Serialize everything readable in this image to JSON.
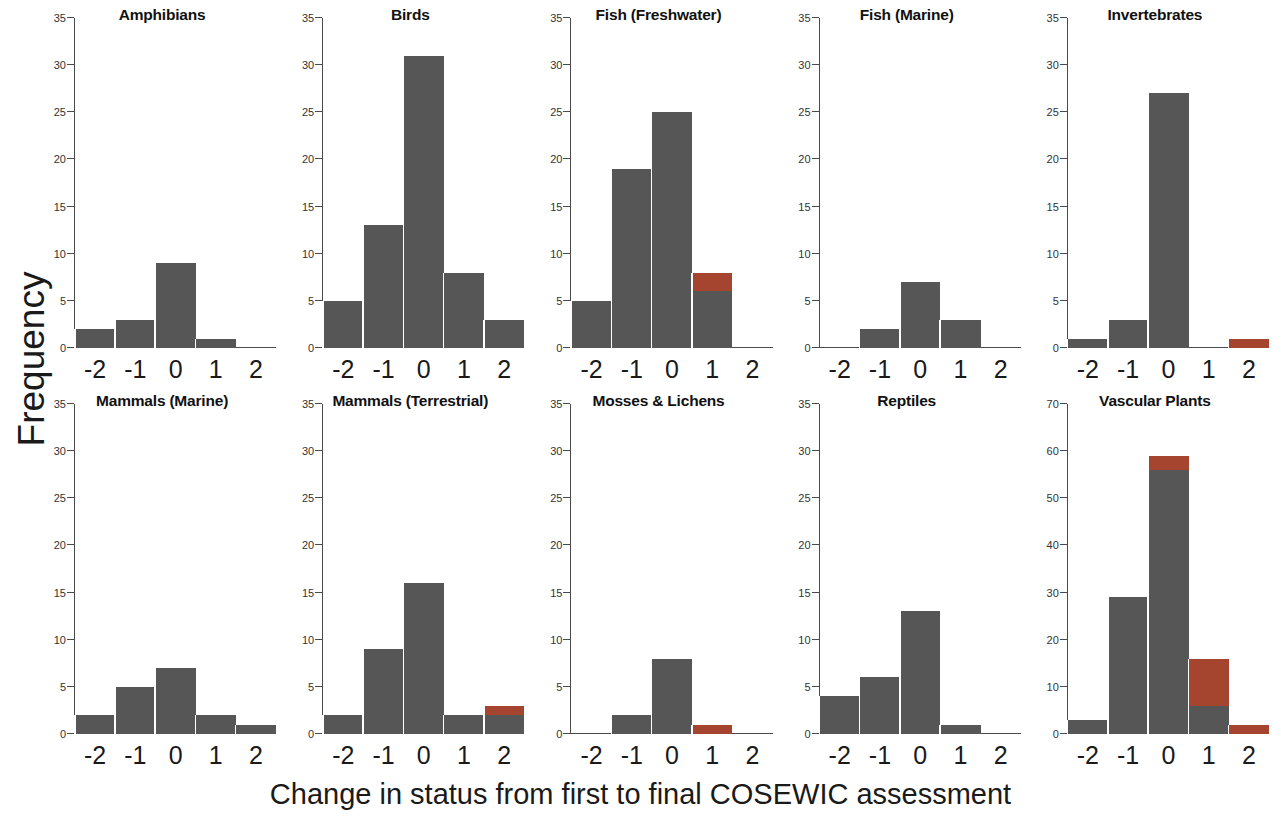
{
  "figure": {
    "xlabel": "Change in status from first to final COSEWIC assessment",
    "ylabel": "Frequency"
  },
  "chart_data": {
    "type": "bar",
    "title": "",
    "subtitle": "",
    "xlabel": "Change in status from first to final COSEWIC assessment",
    "ylabel": "Frequency",
    "layout": "5 columns x 2 rows small-multiples (facets)",
    "grid": false,
    "legend": "none",
    "stacked": true,
    "categories": [
      "-2",
      "-1",
      "0",
      "1",
      "2"
    ],
    "colors": {
      "gray": "#565656",
      "red": "#a6452f",
      "axis": "#4a4a4a",
      "background": "#ffffff"
    },
    "series_names": [
      "gray",
      "red"
    ],
    "panels": [
      {
        "title": "Amphibians",
        "ylim": [
          0,
          35
        ],
        "yticks": [
          0,
          5,
          10,
          15,
          20,
          25,
          30,
          35
        ],
        "categories": [
          "-2",
          "-1",
          "0",
          "1",
          "2"
        ],
        "gray": [
          2,
          3,
          9,
          1,
          0
        ],
        "red": [
          0,
          0,
          0,
          0,
          0
        ],
        "totals": [
          2,
          3,
          9,
          1,
          0
        ]
      },
      {
        "title": "Birds",
        "ylim": [
          0,
          35
        ],
        "yticks": [
          0,
          5,
          10,
          15,
          20,
          25,
          30,
          35
        ],
        "categories": [
          "-2",
          "-1",
          "0",
          "1",
          "2"
        ],
        "gray": [
          5,
          13,
          31,
          8,
          3
        ],
        "red": [
          0,
          0,
          0,
          0,
          0
        ],
        "totals": [
          5,
          13,
          31,
          8,
          3
        ]
      },
      {
        "title": "Fish (Freshwater)",
        "ylim": [
          0,
          35
        ],
        "yticks": [
          0,
          5,
          10,
          15,
          20,
          25,
          30,
          35
        ],
        "categories": [
          "-2",
          "-1",
          "0",
          "1",
          "2"
        ],
        "gray": [
          5,
          19,
          25,
          6,
          0
        ],
        "red": [
          0,
          0,
          0,
          2,
          0
        ],
        "totals": [
          5,
          19,
          25,
          8,
          0
        ]
      },
      {
        "title": "Fish (Marine)",
        "ylim": [
          0,
          35
        ],
        "yticks": [
          0,
          5,
          10,
          15,
          20,
          25,
          30,
          35
        ],
        "categories": [
          "-2",
          "-1",
          "0",
          "1",
          "2"
        ],
        "gray": [
          0,
          2,
          7,
          3,
          0
        ],
        "red": [
          0,
          0,
          0,
          0,
          0
        ],
        "totals": [
          0,
          2,
          7,
          3,
          0
        ]
      },
      {
        "title": "Invertebrates",
        "ylim": [
          0,
          35
        ],
        "yticks": [
          0,
          5,
          10,
          15,
          20,
          25,
          30,
          35
        ],
        "categories": [
          "-2",
          "-1",
          "0",
          "1",
          "2"
        ],
        "gray": [
          1,
          3,
          27,
          0,
          0
        ],
        "red": [
          0,
          0,
          0,
          0,
          1
        ],
        "totals": [
          1,
          3,
          27,
          0,
          1
        ]
      },
      {
        "title": "Mammals (Marine)",
        "ylim": [
          0,
          35
        ],
        "yticks": [
          0,
          5,
          10,
          15,
          20,
          25,
          30,
          35
        ],
        "categories": [
          "-2",
          "-1",
          "0",
          "1",
          "2"
        ],
        "gray": [
          2,
          5,
          7,
          2,
          1
        ],
        "red": [
          0,
          0,
          0,
          0,
          0
        ],
        "totals": [
          2,
          5,
          7,
          2,
          1
        ]
      },
      {
        "title": "Mammals (Terrestrial)",
        "ylim": [
          0,
          35
        ],
        "yticks": [
          0,
          5,
          10,
          15,
          20,
          25,
          30,
          35
        ],
        "categories": [
          "-2",
          "-1",
          "0",
          "1",
          "2"
        ],
        "gray": [
          2,
          9,
          16,
          2,
          2
        ],
        "red": [
          0,
          0,
          0,
          0,
          1
        ],
        "totals": [
          2,
          9,
          16,
          2,
          3
        ]
      },
      {
        "title": "Mosses & Lichens",
        "ylim": [
          0,
          35
        ],
        "yticks": [
          0,
          5,
          10,
          15,
          20,
          25,
          30,
          35
        ],
        "categories": [
          "-2",
          "-1",
          "0",
          "1",
          "2"
        ],
        "gray": [
          0,
          2,
          8,
          0,
          0
        ],
        "red": [
          0,
          0,
          0,
          1,
          0
        ],
        "totals": [
          0,
          2,
          8,
          1,
          0
        ]
      },
      {
        "title": "Reptiles",
        "ylim": [
          0,
          35
        ],
        "yticks": [
          0,
          5,
          10,
          15,
          20,
          25,
          30,
          35
        ],
        "categories": [
          "-2",
          "-1",
          "0",
          "1",
          "2"
        ],
        "gray": [
          4,
          6,
          13,
          1,
          0
        ],
        "red": [
          0,
          0,
          0,
          0,
          0
        ],
        "totals": [
          4,
          6,
          13,
          1,
          0
        ]
      },
      {
        "title": "Vascular Plants",
        "ylim": [
          0,
          70
        ],
        "yticks": [
          0,
          10,
          20,
          30,
          40,
          50,
          60,
          70
        ],
        "categories": [
          "-2",
          "-1",
          "0",
          "1",
          "2"
        ],
        "gray": [
          3,
          29,
          56,
          6,
          0
        ],
        "red": [
          0,
          0,
          3,
          10,
          2
        ],
        "totals": [
          3,
          29,
          59,
          16,
          2
        ]
      }
    ]
  }
}
